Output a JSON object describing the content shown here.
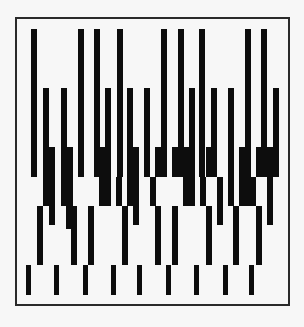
{
  "figure": {
    "title": "Vertical bar pattern (weave-like abstract design)",
    "background": "#f7f7f7",
    "ink": "#0d0d0d",
    "frame": {
      "x": 15,
      "y": 17,
      "w": 275,
      "h": 289,
      "color": "#2a2a2a"
    }
  },
  "bars": [
    {
      "x": 31,
      "y": 29,
      "w": 6,
      "h": 148
    },
    {
      "x": 78,
      "y": 29,
      "w": 6,
      "h": 148
    },
    {
      "x": 94,
      "y": 29,
      "w": 6,
      "h": 148
    },
    {
      "x": 117,
      "y": 29,
      "w": 6,
      "h": 148
    },
    {
      "x": 161,
      "y": 29,
      "w": 6,
      "h": 148
    },
    {
      "x": 178,
      "y": 29,
      "w": 6,
      "h": 148
    },
    {
      "x": 199,
      "y": 29,
      "w": 6,
      "h": 148
    },
    {
      "x": 245,
      "y": 29,
      "w": 6,
      "h": 148
    },
    {
      "x": 261,
      "y": 29,
      "w": 6,
      "h": 148
    },
    {
      "x": 43,
      "y": 88,
      "w": 6,
      "h": 118
    },
    {
      "x": 61,
      "y": 88,
      "w": 6,
      "h": 118
    },
    {
      "x": 105,
      "y": 88,
      "w": 6,
      "h": 118
    },
    {
      "x": 127,
      "y": 88,
      "w": 6,
      "h": 118
    },
    {
      "x": 144,
      "y": 88,
      "w": 6,
      "h": 89
    },
    {
      "x": 189,
      "y": 88,
      "w": 6,
      "h": 118
    },
    {
      "x": 211,
      "y": 88,
      "w": 6,
      "h": 89
    },
    {
      "x": 228,
      "y": 88,
      "w": 6,
      "h": 118
    },
    {
      "x": 273,
      "y": 88,
      "w": 6,
      "h": 89
    },
    {
      "x": 43,
      "y": 147,
      "w": 12,
      "h": 59
    },
    {
      "x": 61,
      "y": 147,
      "w": 12,
      "h": 59
    },
    {
      "x": 94,
      "y": 147,
      "w": 17,
      "h": 30
    },
    {
      "x": 99,
      "y": 147,
      "w": 12,
      "h": 59
    },
    {
      "x": 127,
      "y": 147,
      "w": 12,
      "h": 59
    },
    {
      "x": 155,
      "y": 147,
      "w": 12,
      "h": 30
    },
    {
      "x": 172,
      "y": 147,
      "w": 12,
      "h": 30
    },
    {
      "x": 183,
      "y": 147,
      "w": 12,
      "h": 59
    },
    {
      "x": 206,
      "y": 147,
      "w": 11,
      "h": 30
    },
    {
      "x": 239,
      "y": 147,
      "w": 12,
      "h": 59
    },
    {
      "x": 256,
      "y": 147,
      "w": 11,
      "h": 30
    },
    {
      "x": 267,
      "y": 147,
      "w": 12,
      "h": 30
    },
    {
      "x": 49,
      "y": 177,
      "w": 6,
      "h": 48
    },
    {
      "x": 66,
      "y": 177,
      "w": 7,
      "h": 52
    },
    {
      "x": 116,
      "y": 177,
      "w": 6,
      "h": 29
    },
    {
      "x": 133,
      "y": 177,
      "w": 6,
      "h": 48
    },
    {
      "x": 150,
      "y": 177,
      "w": 6,
      "h": 29
    },
    {
      "x": 200,
      "y": 177,
      "w": 6,
      "h": 29
    },
    {
      "x": 217,
      "y": 177,
      "w": 6,
      "h": 48
    },
    {
      "x": 250,
      "y": 177,
      "w": 6,
      "h": 29
    },
    {
      "x": 267,
      "y": 177,
      "w": 6,
      "h": 48
    },
    {
      "x": 37,
      "y": 206,
      "w": 6,
      "h": 59
    },
    {
      "x": 71,
      "y": 206,
      "w": 6,
      "h": 59
    },
    {
      "x": 88,
      "y": 206,
      "w": 6,
      "h": 59
    },
    {
      "x": 122,
      "y": 206,
      "w": 6,
      "h": 59
    },
    {
      "x": 155,
      "y": 206,
      "w": 6,
      "h": 59
    },
    {
      "x": 172,
      "y": 206,
      "w": 6,
      "h": 59
    },
    {
      "x": 206,
      "y": 206,
      "w": 6,
      "h": 59
    },
    {
      "x": 233,
      "y": 206,
      "w": 6,
      "h": 59
    },
    {
      "x": 256,
      "y": 206,
      "w": 6,
      "h": 59
    },
    {
      "x": 26,
      "y": 265,
      "w": 5,
      "h": 30
    },
    {
      "x": 54,
      "y": 265,
      "w": 5,
      "h": 30
    },
    {
      "x": 83,
      "y": 265,
      "w": 5,
      "h": 30
    },
    {
      "x": 111,
      "y": 265,
      "w": 5,
      "h": 30
    },
    {
      "x": 137,
      "y": 265,
      "w": 5,
      "h": 30
    },
    {
      "x": 166,
      "y": 265,
      "w": 5,
      "h": 30
    },
    {
      "x": 194,
      "y": 265,
      "w": 5,
      "h": 30
    },
    {
      "x": 223,
      "y": 265,
      "w": 5,
      "h": 30
    },
    {
      "x": 249,
      "y": 265,
      "w": 5,
      "h": 30
    }
  ]
}
